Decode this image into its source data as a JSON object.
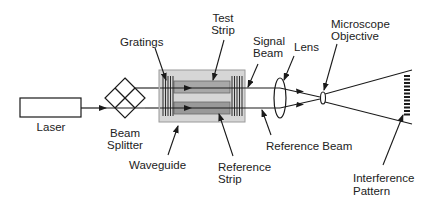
{
  "diagram": {
    "type": "optical-setup",
    "components": [
      {
        "id": "laser",
        "label": "Laser"
      },
      {
        "id": "beam-splitter",
        "label": "Beam Splitter"
      },
      {
        "id": "gratings",
        "label": "Gratings"
      },
      {
        "id": "test-strip",
        "label": "Test Strip"
      },
      {
        "id": "waveguide",
        "label": "Waveguide"
      },
      {
        "id": "reference-strip",
        "label": "Reference Strip"
      },
      {
        "id": "signal-beam",
        "label": "Signal Beam"
      },
      {
        "id": "lens",
        "label": "Lens"
      },
      {
        "id": "reference-beam",
        "label": "Reference Beam"
      },
      {
        "id": "microscope-objective",
        "label": "Microscope Objective"
      },
      {
        "id": "interference-pattern",
        "label": "Interference Pattern"
      }
    ],
    "connections": [
      {
        "from": "laser",
        "to": "beam-splitter"
      },
      {
        "from": "beam-splitter",
        "to": "test-strip",
        "via": "upper beam"
      },
      {
        "from": "beam-splitter",
        "to": "reference-strip",
        "via": "lower beam"
      },
      {
        "from": "test-strip",
        "to": "lens",
        "via": "signal-beam"
      },
      {
        "from": "reference-strip",
        "to": "lens",
        "via": "reference-beam"
      },
      {
        "from": "lens",
        "to": "microscope-objective"
      },
      {
        "from": "microscope-objective",
        "to": "interference-pattern"
      }
    ]
  },
  "labels": {
    "laser": "Laser",
    "beam_splitter_1": "Beam",
    "beam_splitter_2": "Splitter",
    "gratings": "Gratings",
    "test_strip_1": "Test",
    "test_strip_2": "Strip",
    "waveguide": "Waveguide",
    "reference_strip_1": "Reference",
    "reference_strip_2": "Strip",
    "signal_beam_1": "Signal",
    "signal_beam_2": "Beam",
    "lens": "Lens",
    "reference_beam": "Reference Beam",
    "microscope_objective_1": "Microscope",
    "microscope_objective_2": "Objective",
    "interference_pattern_1": "Interference",
    "interference_pattern_2": "Pattern"
  },
  "colors": {
    "line": "#1a1a1a",
    "waveguide_fill": "#d6d6d6",
    "waveguide_border": "#9a9a9a",
    "strip_fill": "#9c9c9c",
    "background": "#ffffff"
  }
}
